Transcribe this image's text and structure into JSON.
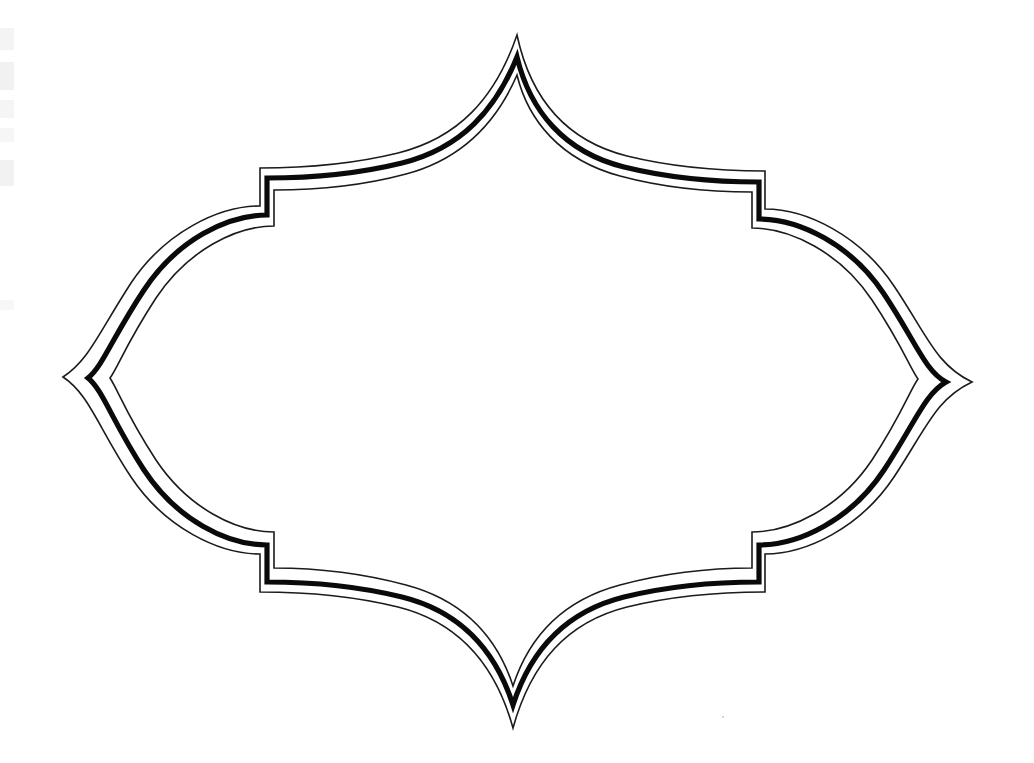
{
  "document": {
    "title": "Decorative Frame Outline",
    "medium": "scanned line drawing on white paper",
    "page_width": 1034,
    "page_height": 763,
    "background_color": "#ffffff"
  },
  "artwork": {
    "name": "quatrefoil-ogee-frame",
    "description": "Blank decorative label frame with four pointed cusps and four stepped corner notches, drawn as three concentric outlines",
    "ink_color": "#0a0a0a",
    "thin_line_color": "#1b1b1b",
    "line_count": 3,
    "lines": [
      {
        "role": "outer-thin",
        "stroke_width": 1.6,
        "color": "#1b1b1b"
      },
      {
        "role": "middle-thick",
        "stroke_width": 5.2,
        "color": "#0a0a0a"
      },
      {
        "role": "inner-thin",
        "stroke_width": 1.6,
        "color": "#1b1b1b"
      }
    ],
    "cusp_points": [
      {
        "name": "top-cusp",
        "x": 517,
        "y": 35
      },
      {
        "name": "right-cusp",
        "x": 972,
        "y": 382
      },
      {
        "name": "bottom-cusp",
        "x": 511,
        "y": 728
      },
      {
        "name": "left-cusp",
        "x": 63,
        "y": 377
      }
    ],
    "bounds": {
      "left": 63,
      "top": 35,
      "right": 972,
      "bottom": 728
    },
    "interior_fill": "#ffffff",
    "artifacts": {
      "left_margin_smudges": 6,
      "specks": [
        {
          "x": 405,
          "y": 578
        },
        {
          "x": 722,
          "y": 716
        }
      ]
    }
  }
}
